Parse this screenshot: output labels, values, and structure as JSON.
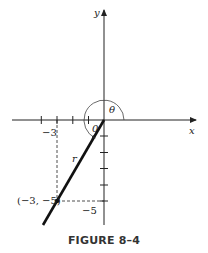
{
  "figure": {
    "caption": "FIGURE 8–4",
    "axes": {
      "x_label": "x",
      "y_label": "y"
    },
    "angle_label": "θ",
    "radius_label": "r",
    "origin_label": "0",
    "point": {
      "label": "(−3, −5)",
      "x": -3,
      "y": -5
    },
    "tick_labels": {
      "x_minus_3": "−3",
      "y_minus_5": "−5"
    },
    "colors": {
      "ink": "#222222",
      "background": "#ffffff"
    }
  }
}
